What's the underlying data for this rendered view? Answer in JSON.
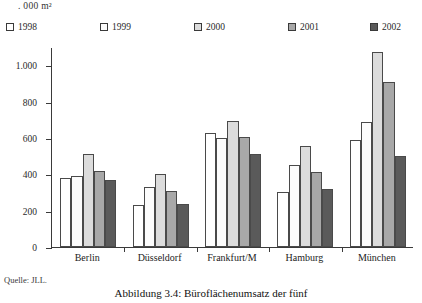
{
  "unit_label": ". 000 m²",
  "source_note": "Quelle: JLL.",
  "caption": "Abbildung 3.4: Büroflächenumsatz der fünf",
  "legend": {
    "items": [
      {
        "label": "1998",
        "color": "#ffffff"
      },
      {
        "label": "1999",
        "color": "#fcfcfc"
      },
      {
        "label": "2000",
        "color": "#dcdcdc"
      },
      {
        "label": "2001",
        "color": "#a8a8a8"
      },
      {
        "label": "2002",
        "color": "#5a5a5a"
      }
    ]
  },
  "chart_data": {
    "type": "bar",
    "title": "Abbildung 3.4: Büroflächenumsatz der fünf",
    "xlabel": "",
    "ylabel": ". 000 m²",
    "ylim": [
      0,
      1100
    ],
    "yticks": [
      0,
      200,
      400,
      600,
      800,
      1000
    ],
    "ytick_labels": [
      "0",
      "200",
      "400",
      "600",
      "800",
      "1.000"
    ],
    "grid": false,
    "legend_position": "top",
    "categories": [
      "Berlin",
      "Düsseldorf",
      "Frankfurt/M",
      "Hamburg",
      "München"
    ],
    "series": [
      {
        "name": "1998",
        "color": "#ffffff",
        "values": [
          380,
          230,
          625,
          300,
          590
        ]
      },
      {
        "name": "1999",
        "color": "#fcfcfc",
        "values": [
          390,
          330,
          600,
          450,
          690
        ]
      },
      {
        "name": "2000",
        "color": "#dcdcdc",
        "values": [
          510,
          400,
          695,
          555,
          1075
        ]
      },
      {
        "name": "2001",
        "color": "#a8a8a8",
        "values": [
          420,
          310,
          605,
          410,
          905
        ]
      },
      {
        "name": "2002",
        "color": "#5a5a5a",
        "values": [
          370,
          235,
          510,
          320,
          500
        ]
      }
    ]
  }
}
